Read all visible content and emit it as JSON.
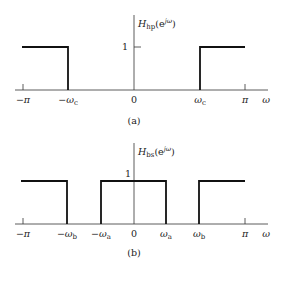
{
  "panels": [
    {
      "id": "a",
      "caption": "(a)",
      "function_label": {
        "main": "H",
        "sub": "hp",
        "open": "(e",
        "sup": "jω",
        "close": ")"
      },
      "y_tick_label": "1",
      "x_tick_labels": {
        "neg_pi": "−π",
        "neg_wc": "−ω",
        "neg_wc_sub": "c",
        "zero": "0",
        "wc": "ω",
        "wc_sub": "c",
        "pi": "π",
        "axis": "ω"
      },
      "description": "Ideal highpass filter frequency response: magnitude 1 for ωc < |ω| ≤ π, 0 otherwise"
    },
    {
      "id": "b",
      "caption": "(b)",
      "function_label": {
        "main": "H",
        "sub": "bs",
        "open": "(e",
        "sup": "jω",
        "close": ")"
      },
      "y_tick_label": "1",
      "x_tick_labels": {
        "neg_pi": "−π",
        "neg_wb": "−ω",
        "neg_wb_sub": "b",
        "neg_wa": "−ω",
        "neg_wa_sub": "a",
        "zero": "0",
        "wa": "ω",
        "wa_sub": "a",
        "wb": "ω",
        "wb_sub": "b",
        "pi": "π",
        "axis": "ω"
      },
      "description": "Ideal bandstop filter frequency response: magnitude 1 for |ω| < ωa and ωb < |ω| ≤ π, 0 for ωa < |ω| < ωb"
    }
  ]
}
